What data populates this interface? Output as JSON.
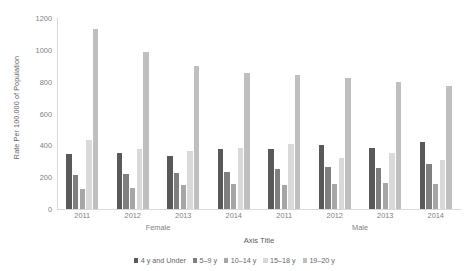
{
  "chart_data": {
    "type": "bar",
    "title": "",
    "xlabel": "Axis Title",
    "ylabel": "Rate Per 100,000 of Population",
    "ylim": [
      0,
      1200
    ],
    "ytick_step": 200,
    "yticks": [
      "0",
      "200",
      "400",
      "600",
      "800",
      "1000",
      "1200"
    ],
    "grid": false,
    "legend_position": "bottom",
    "categories": [
      "2011",
      "2012",
      "2013",
      "2014",
      "2011",
      "2012",
      "2013",
      "2014"
    ],
    "group_labels": [
      {
        "label": "Female",
        "center_percent": 25
      },
      {
        "label": "Male",
        "center_percent": 75
      }
    ],
    "series": [
      {
        "name": "4 y and Under",
        "color": "#595959",
        "values": [
          345,
          350,
          335,
          375,
          380,
          400,
          385,
          420
        ]
      },
      {
        "name": "5–9 y",
        "color": "#7F7F7F",
        "values": [
          215,
          220,
          225,
          235,
          250,
          265,
          260,
          280
        ]
      },
      {
        "name": "10–14 y",
        "color": "#A6A6A6",
        "values": [
          125,
          135,
          150,
          155,
          150,
          160,
          165,
          160
        ]
      },
      {
        "name": "15–18 y",
        "color": "#D9D9D9",
        "values": [
          435,
          380,
          365,
          385,
          410,
          320,
          350,
          310
        ]
      },
      {
        "name": "19–20 y",
        "color": "#BFBFBF",
        "values": [
          1130,
          985,
          900,
          855,
          845,
          825,
          795,
          775
        ]
      }
    ]
  }
}
